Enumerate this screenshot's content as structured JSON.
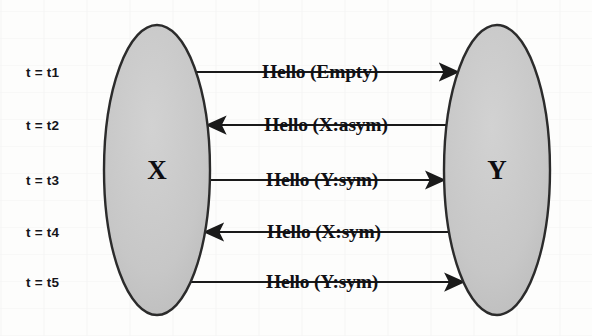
{
  "figure": {
    "type": "message-sequence-diagram",
    "background_color": "#fdfdfc",
    "node_fill_color": "#c9c9c9",
    "node_stroke_color": "#2b2b2b",
    "line_color": "#1a1a1a",
    "nodes": [
      {
        "id": "X",
        "label": "X",
        "cx": 157,
        "cy": 170,
        "rx": 53,
        "ry": 145
      },
      {
        "id": "Y",
        "label": "Y",
        "cx": 497,
        "cy": 170,
        "rx": 53,
        "ry": 145
      }
    ],
    "messages": [
      {
        "time_label": "t = t1",
        "text": "Hello (Empty)",
        "direction": "right",
        "from": "X",
        "to": "Y",
        "y": 72,
        "label_x": 320
      },
      {
        "time_label": "t = t2",
        "text": "Hello (X:asym)",
        "direction": "left",
        "from": "Y",
        "to": "X",
        "y": 125,
        "label_x": 326
      },
      {
        "time_label": "t = t3",
        "text": "Hello (Y:sym)",
        "direction": "right",
        "from": "X",
        "to": "Y",
        "y": 180,
        "label_x": 322
      },
      {
        "time_label": "t = t4",
        "text": "Hello (X:sym)",
        "direction": "left",
        "from": "Y",
        "to": "X",
        "y": 232,
        "label_x": 324
      },
      {
        "time_label": "t = t5",
        "text": "Hello (Y:sym)",
        "direction": "right",
        "from": "X",
        "to": "Y",
        "y": 282,
        "label_x": 322
      }
    ],
    "time_label_x": 26
  }
}
